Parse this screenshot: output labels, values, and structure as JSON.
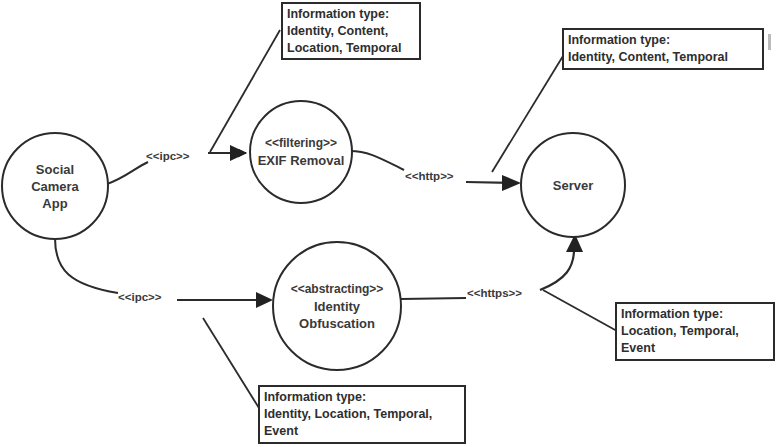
{
  "diagram": {
    "nodes": [
      {
        "id": "social-camera-app",
        "stereotype": "",
        "lines": [
          "Social",
          "Camera",
          "App"
        ]
      },
      {
        "id": "exif-removal",
        "stereotype": "<<filtering>>",
        "lines": [
          "EXIF Removal"
        ]
      },
      {
        "id": "identity-obfuscation",
        "stereotype": "<<abstracting>>",
        "lines": [
          "Identity",
          "Obfuscation"
        ]
      },
      {
        "id": "server",
        "stereotype": "",
        "lines": [
          "Server"
        ]
      }
    ],
    "edges": [
      {
        "id": "app-to-exif",
        "from": "social-camera-app",
        "to": "exif-removal",
        "label": "<<ipc>>"
      },
      {
        "id": "exif-to-server",
        "from": "exif-removal",
        "to": "server",
        "label": "<<http>>"
      },
      {
        "id": "app-to-obfuscation",
        "from": "social-camera-app",
        "to": "identity-obfuscation",
        "label": "<<ipc>>"
      },
      {
        "id": "obfuscation-to-server",
        "from": "identity-obfuscation",
        "to": "server",
        "label": "<<https>>"
      }
    ],
    "notes": [
      {
        "id": "note-app-exif",
        "attached_to": "app-to-exif",
        "title": "Information type:",
        "lines": [
          "Identity, Content,",
          "Location, Temporal"
        ]
      },
      {
        "id": "note-exif-server",
        "attached_to": "exif-to-server",
        "title": "Information type:",
        "lines": [
          "Identity, Content, Temporal"
        ]
      },
      {
        "id": "note-obfuscation-server",
        "attached_to": "obfuscation-to-server",
        "title": "Information type:",
        "lines": [
          "Location, Temporal,",
          "Event"
        ]
      },
      {
        "id": "note-app-obfuscation",
        "attached_to": "app-to-obfuscation",
        "title": "Information type:",
        "lines": [
          "Identity, Location, Temporal,",
          "Event"
        ]
      }
    ]
  }
}
